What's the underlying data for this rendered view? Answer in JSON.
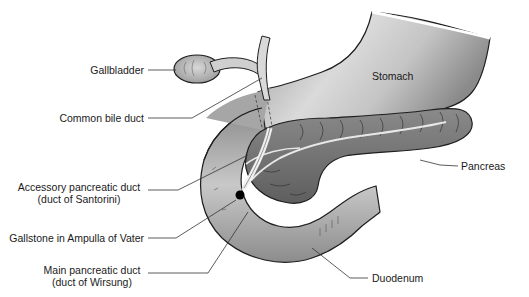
{
  "diagram": {
    "labels": {
      "gallbladder": "Gallbladder",
      "common_bile_duct": "Common bile duct",
      "accessory_duct_line1": "Accessory pancreatic duct",
      "accessory_duct_line2": "(duct of Santorini)",
      "gallstone": "Gallstone in Ampulla of Vater",
      "main_duct_line1": "Main pancreatic duct",
      "main_duct_line2": "(duct of Wirsung)",
      "stomach": "Stomach",
      "pancreas": "Pancreas",
      "duodenum": "Duodenum"
    },
    "colors": {
      "organ_light": "#d4d4d4",
      "organ_mid": "#a8a8a8",
      "organ_dark": "#6e6e6e",
      "pancreas": "#7a7a7a",
      "outline": "#1e1e1e",
      "leader": "#333333",
      "gallstone": "#000000",
      "background": "#ffffff"
    }
  }
}
